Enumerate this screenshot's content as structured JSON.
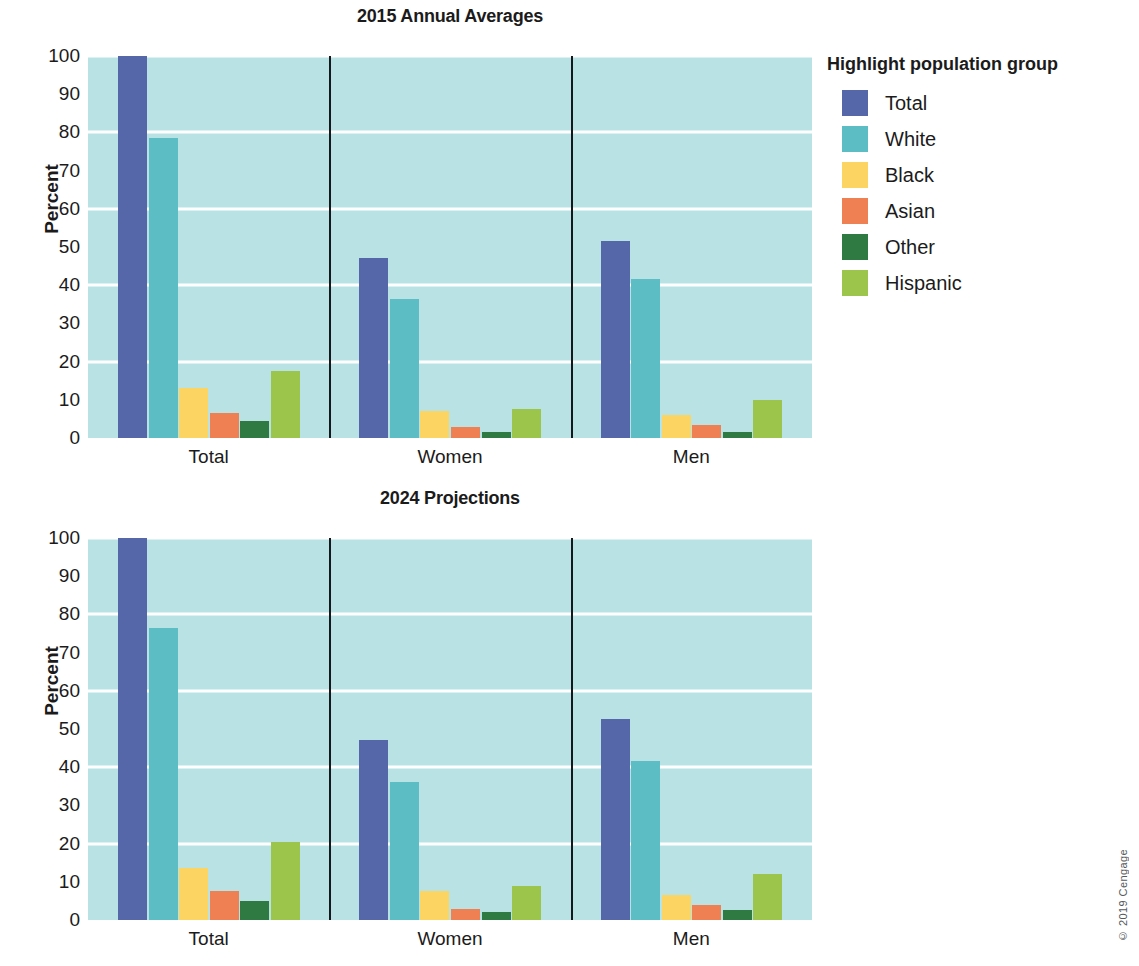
{
  "figure": {
    "credit": "© 2019 Cengage"
  },
  "legend": {
    "title": "Highlight population group",
    "position": "right",
    "items": [
      {
        "label": "Total",
        "color": "#5567a8"
      },
      {
        "label": "White",
        "color": "#5cbdc4"
      },
      {
        "label": "Black",
        "color": "#fcd462"
      },
      {
        "label": "Asian",
        "color": "#ef8054"
      },
      {
        "label": "Other",
        "color": "#2f7a43"
      },
      {
        "label": "Hispanic",
        "color": "#9cc64b"
      }
    ]
  },
  "axis": {
    "ylabel": "Percent",
    "yticks": [
      "0",
      "10",
      "20",
      "30",
      "40",
      "50",
      "60",
      "70",
      "80",
      "90",
      "100"
    ],
    "gridlines": [
      20,
      40,
      60,
      80,
      100
    ]
  },
  "chart_data": [
    {
      "type": "bar",
      "title": "2015 Annual Averages",
      "xlabel": "",
      "ylabel": "Percent",
      "ylim": [
        0,
        100
      ],
      "grid": true,
      "legend_position": "right",
      "categories": [
        "Total",
        "Women",
        "Men"
      ],
      "series": [
        {
          "name": "Total",
          "color": "#5567a8",
          "values": [
            100,
            47,
            51.5
          ]
        },
        {
          "name": "White",
          "color": "#5cbdc4",
          "values": [
            78.5,
            36.5,
            41.5
          ]
        },
        {
          "name": "Black",
          "color": "#fcd462",
          "values": [
            13,
            7,
            6
          ]
        },
        {
          "name": "Asian",
          "color": "#ef8054",
          "values": [
            6.5,
            3,
            3.5
          ]
        },
        {
          "name": "Other",
          "color": "#2f7a43",
          "values": [
            4.5,
            1.5,
            1.5
          ]
        },
        {
          "name": "Hispanic",
          "color": "#9cc64b",
          "values": [
            17.5,
            7.5,
            10
          ]
        }
      ]
    },
    {
      "type": "bar",
      "title": "2024 Projections",
      "xlabel": "",
      "ylabel": "Percent",
      "ylim": [
        0,
        100
      ],
      "grid": true,
      "legend_position": "right",
      "categories": [
        "Total",
        "Women",
        "Men"
      ],
      "series": [
        {
          "name": "Total",
          "color": "#5567a8",
          "values": [
            100,
            47,
            52.5
          ]
        },
        {
          "name": "White",
          "color": "#5cbdc4",
          "values": [
            76.5,
            36,
            41.5
          ]
        },
        {
          "name": "Black",
          "color": "#fcd462",
          "values": [
            13.5,
            7.5,
            6.5
          ]
        },
        {
          "name": "Asian",
          "color": "#ef8054",
          "values": [
            7.5,
            3,
            4
          ]
        },
        {
          "name": "Other",
          "color": "#2f7a43",
          "values": [
            5,
            2,
            2.5
          ]
        },
        {
          "name": "Hispanic",
          "color": "#9cc64b",
          "values": [
            20.5,
            9,
            12
          ]
        }
      ]
    }
  ]
}
